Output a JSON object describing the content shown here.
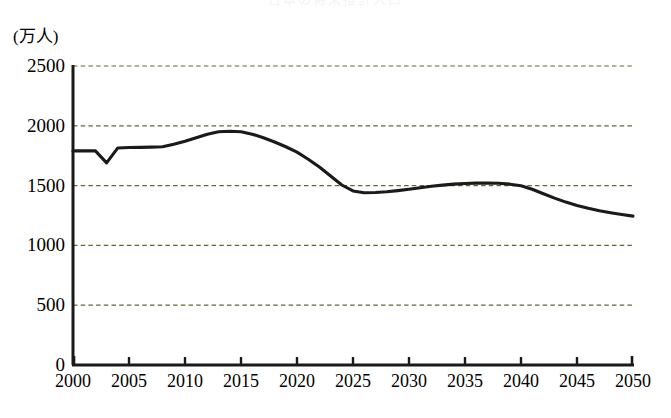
{
  "chart_data": {
    "type": "line",
    "title": "日本の将来推計人口",
    "unit_label": "(万人)",
    "xlabel": "",
    "ylabel": "",
    "xlim": [
      2000,
      2050
    ],
    "ylim": [
      0,
      2500
    ],
    "grid": true,
    "legend": null,
    "y_ticks": [
      0,
      500,
      1000,
      1500,
      2000,
      2500
    ],
    "y_tick_labels": [
      "0",
      "500",
      "1000",
      "1500",
      "2000",
      "2500"
    ],
    "x_ticks": [
      2000,
      2005,
      2010,
      2015,
      2020,
      2025,
      2030,
      2035,
      2040,
      2045,
      2050
    ],
    "x_tick_labels": [
      "2000",
      "2005",
      "2010",
      "2015",
      "2020",
      "2025",
      "2030",
      "2035",
      "2040",
      "2045",
      "2050"
    ],
    "series": [
      {
        "name": "推計人口",
        "color": "#1a1a1a",
        "x": [
          2000,
          2001,
          2002,
          2003,
          2004,
          2005,
          2006,
          2007,
          2008,
          2009,
          2010,
          2011,
          2012,
          2013,
          2014,
          2015,
          2016,
          2017,
          2018,
          2019,
          2020,
          2021,
          2022,
          2023,
          2024,
          2025,
          2026,
          2027,
          2028,
          2029,
          2030,
          2031,
          2032,
          2033,
          2034,
          2035,
          2036,
          2037,
          2038,
          2039,
          2040,
          2041,
          2042,
          2043,
          2044,
          2045,
          2046,
          2047,
          2048,
          2049,
          2050
        ],
        "values": [
          1790,
          1790,
          1790,
          1690,
          1815,
          1818,
          1820,
          1822,
          1825,
          1845,
          1870,
          1900,
          1930,
          1950,
          1955,
          1950,
          1930,
          1900,
          1865,
          1825,
          1780,
          1720,
          1655,
          1580,
          1505,
          1455,
          1440,
          1442,
          1448,
          1458,
          1470,
          1482,
          1494,
          1504,
          1512,
          1518,
          1521,
          1522,
          1520,
          1512,
          1498,
          1470,
          1432,
          1395,
          1362,
          1334,
          1310,
          1290,
          1273,
          1258,
          1245
        ]
      }
    ]
  },
  "axes": {
    "plot_left_px": 73,
    "plot_right_px": 633,
    "plot_top_px": 66,
    "plot_bottom_px": 365
  },
  "style": {
    "gridline_color": "#5c6b33",
    "axis_color": "#1a1a1a",
    "line_color": "#1a1a1a",
    "background": "#ffffff"
  }
}
